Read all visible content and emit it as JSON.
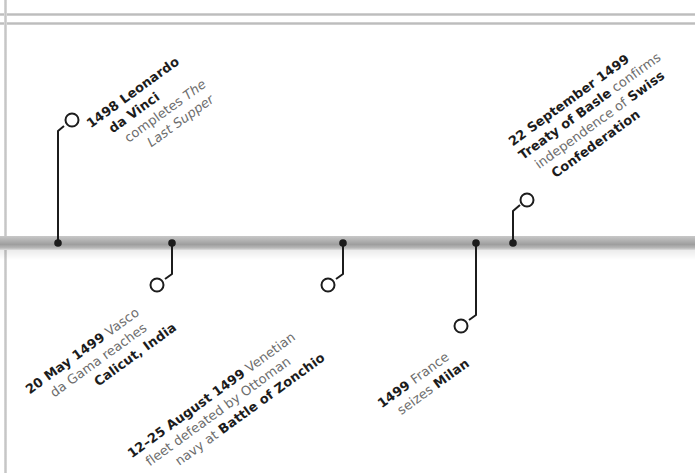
{
  "timeline": {
    "bar_color": "#a9a9a9",
    "connector_color": "#1c1c1c",
    "events": [
      {
        "id": "leonardo",
        "position": "above",
        "lines": [
          {
            "bold": "1498",
            "normal": " Leonardo"
          },
          {
            "bold": "da Vinci",
            "normal": ""
          },
          {
            "bold": "",
            "normal": "completes ",
            "italic": "The"
          },
          {
            "bold": "",
            "normal": "",
            "italic": "Last Supper"
          }
        ]
      },
      {
        "id": "vasco-da-gama",
        "position": "below",
        "lines": [
          {
            "bold": "20 May 1499",
            "normal": " Vasco"
          },
          {
            "bold": "",
            "normal": "da Gama reaches"
          },
          {
            "bold": "Calicut, India",
            "normal": ""
          }
        ]
      },
      {
        "id": "battle-of-zonchio",
        "position": "below",
        "lines": [
          {
            "bold": "12–25 August 1499",
            "normal": " Venetian"
          },
          {
            "bold": "",
            "normal": "fleet defeated by Ottoman"
          },
          {
            "bold": "Battle of Zonchio",
            "normal": "navy at "
          }
        ]
      },
      {
        "id": "france-milan",
        "position": "below",
        "lines": [
          {
            "bold": "1499",
            "normal": " France"
          },
          {
            "bold": "Milan",
            "normal": "seizes "
          }
        ]
      },
      {
        "id": "treaty-of-basle",
        "position": "above",
        "lines": [
          {
            "bold": "22 September 1499",
            "normal": ""
          },
          {
            "bold": "Treaty of Basle",
            "normal": " confirms"
          },
          {
            "bold": "Swiss",
            "normal": "independence of "
          },
          {
            "bold": "Confederation",
            "normal": ""
          }
        ]
      }
    ]
  }
}
